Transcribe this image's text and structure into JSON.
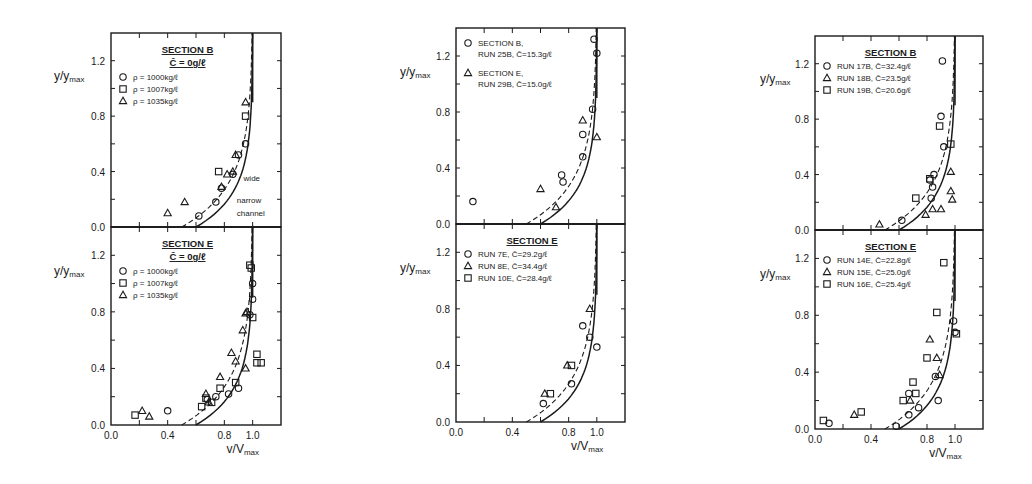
{
  "figure": {
    "background": "#ffffff",
    "ink": "#1a1a1a",
    "x_axis_label": "v/V",
    "x_axis_label_sub": "max",
    "y_axis_label": "y/y",
    "y_axis_label_sub": "max",
    "x_ticks": [
      "0.0",
      "0.4",
      "0.8",
      "1.0"
    ],
    "y_ticks": [
      "0.0",
      "0.4",
      "0.8",
      "1.2"
    ]
  },
  "chart_data": [
    {
      "type": "scatter",
      "panel": "left-top",
      "title": "SECTION B",
      "subtitle": "C̄ = 0g/ℓ",
      "xlabel": "v/Vmax",
      "ylabel": "y/ymax",
      "xlim": [
        0,
        1.0
      ],
      "ylim": [
        0,
        1.4
      ],
      "legend": [
        "ρ = 1000kg/ℓ",
        "ρ = 1007kg/ℓ",
        "ρ = 1035kg/ℓ"
      ],
      "annotations": [
        "wide",
        "narrow channel"
      ],
      "curves": [
        {
          "name": "wide",
          "style": "dashed"
        },
        {
          "name": "narrow channel",
          "style": "solid"
        }
      ],
      "series": [
        {
          "name": "ρ = 1000kg/ℓ",
          "marker": "circle",
          "points": [
            [
              0.62,
              0.08
            ],
            [
              0.74,
              0.18
            ],
            [
              0.78,
              0.28
            ],
            [
              0.86,
              0.38
            ],
            [
              0.9,
              0.52
            ],
            [
              0.95,
              0.6
            ]
          ]
        },
        {
          "name": "ρ = 1007kg/ℓ",
          "marker": "square",
          "points": [
            [
              0.76,
              0.4
            ],
            [
              0.95,
              0.8
            ]
          ]
        },
        {
          "name": "ρ = 1035kg/ℓ",
          "marker": "triangle",
          "points": [
            [
              0.4,
              0.1
            ],
            [
              0.52,
              0.18
            ],
            [
              0.78,
              0.29
            ],
            [
              0.82,
              0.38
            ],
            [
              0.86,
              0.4
            ],
            [
              0.88,
              0.52
            ],
            [
              0.95,
              0.9
            ]
          ]
        }
      ]
    },
    {
      "type": "scatter",
      "panel": "left-bottom",
      "title": "SECTION E",
      "subtitle": "C̄ = 0g/ℓ",
      "xlabel": "v/Vmax",
      "ylabel": "y/ymax",
      "xlim": [
        0,
        1.0
      ],
      "ylim": [
        0,
        1.4
      ],
      "legend": [
        "ρ = 1000kg/ℓ",
        "ρ = 1007kg/ℓ",
        "ρ = 1035kg/ℓ"
      ],
      "series": [
        {
          "name": "ρ = 1000kg/ℓ",
          "marker": "circle",
          "points": [
            [
              0.4,
              0.1
            ],
            [
              0.68,
              0.18
            ],
            [
              0.74,
              0.2
            ],
            [
              0.83,
              0.22
            ],
            [
              0.9,
              0.26
            ],
            [
              1.0,
              1.0
            ],
            [
              1.0,
              0.89
            ],
            [
              0.98,
              0.78
            ]
          ]
        },
        {
          "name": "ρ = 1007kg/ℓ",
          "marker": "square",
          "points": [
            [
              0.17,
              0.07
            ],
            [
              0.64,
              0.13
            ],
            [
              0.67,
              0.19
            ],
            [
              0.71,
              0.16
            ],
            [
              0.77,
              0.26
            ],
            [
              0.88,
              0.3
            ],
            [
              0.98,
              1.13
            ],
            [
              0.99,
              1.11
            ],
            [
              1.0,
              0.76
            ],
            [
              1.03,
              0.5
            ],
            [
              1.03,
              0.44
            ],
            [
              1.06,
              0.44
            ]
          ]
        },
        {
          "name": "ρ = 1035kg/ℓ",
          "marker": "triangle",
          "points": [
            [
              0.22,
              0.1
            ],
            [
              0.27,
              0.06
            ],
            [
              0.67,
              0.22
            ],
            [
              0.69,
              0.16
            ],
            [
              0.77,
              0.34
            ],
            [
              0.85,
              0.51
            ],
            [
              0.88,
              0.45
            ],
            [
              0.93,
              0.67
            ],
            [
              0.95,
              0.79
            ],
            [
              0.96,
              0.8
            ],
            [
              0.95,
              0.4
            ]
          ]
        }
      ]
    },
    {
      "type": "scatter",
      "panel": "middle-top",
      "title": "",
      "xlabel": "v/Vmax",
      "ylabel": "y/ymax",
      "xlim": [
        0,
        1.0
      ],
      "ylim": [
        0,
        1.4
      ],
      "legend": [
        "SECTION B, RUN 25B, C̄=15.3g/ℓ",
        "SECTION E, RUN 29B, C̄=15.0g/ℓ"
      ],
      "series": [
        {
          "name": "SECTION B, RUN 25B, C̄=15.3g/ℓ",
          "marker": "circle",
          "points": [
            [
              0.12,
              0.16
            ],
            [
              0.76,
              0.3
            ],
            [
              0.75,
              0.35
            ],
            [
              0.9,
              0.48
            ],
            [
              0.9,
              0.64
            ],
            [
              0.97,
              0.82
            ],
            [
              1.0,
              1.22
            ],
            [
              0.98,
              1.32
            ]
          ]
        },
        {
          "name": "SECTION E, RUN 29B, C̄=15.0g/ℓ",
          "marker": "triangle",
          "points": [
            [
              0.6,
              0.25
            ],
            [
              0.71,
              0.12
            ],
            [
              0.9,
              0.74
            ],
            [
              1.0,
              0.62
            ]
          ]
        }
      ]
    },
    {
      "type": "scatter",
      "panel": "middle-bottom",
      "title": "SECTION E",
      "xlabel": "v/Vmax",
      "ylabel": "y/ymax",
      "xlim": [
        0,
        1.0
      ],
      "ylim": [
        0,
        1.4
      ],
      "legend": [
        "RUN 7E, C̄=29.2g/ℓ",
        "RUN 8E, C̄=34.4g/ℓ",
        "RUN 10E, C̄=28.4g/ℓ"
      ],
      "series": [
        {
          "name": "RUN 7E, C̄=29.2g/ℓ",
          "marker": "circle",
          "points": [
            [
              0.62,
              0.13
            ],
            [
              0.82,
              0.27
            ],
            [
              0.9,
              0.68
            ],
            [
              0.95,
              0.6
            ],
            [
              1.0,
              0.53
            ]
          ]
        },
        {
          "name": "RUN 8E, C̄=34.4g/ℓ",
          "marker": "triangle",
          "points": [
            [
              0.63,
              0.2
            ],
            [
              0.79,
              0.4
            ],
            [
              0.95,
              0.8
            ]
          ]
        },
        {
          "name": "RUN 10E, C̄=28.4g/ℓ",
          "marker": "square",
          "points": [
            [
              0.67,
              0.2
            ],
            [
              0.82,
              0.4
            ]
          ]
        }
      ]
    },
    {
      "type": "scatter",
      "panel": "right-top",
      "title": "SECTION B",
      "xlabel": "v/Vmax",
      "ylabel": "y/ymax",
      "xlim": [
        0,
        1.0
      ],
      "ylim": [
        0,
        1.4
      ],
      "legend": [
        "RUN 17B, C̄=32.4g/ℓ",
        "RUN 18B, C̄=23.5g/ℓ",
        "RUN 19B, C̄=20.6g/ℓ"
      ],
      "series": [
        {
          "name": "RUN 17B, C̄=32.4g/ℓ",
          "marker": "circle",
          "points": [
            [
              0.62,
              0.07
            ],
            [
              0.83,
              0.23
            ],
            [
              0.84,
              0.31
            ],
            [
              0.82,
              0.36
            ],
            [
              0.85,
              0.4
            ],
            [
              0.92,
              0.6
            ],
            [
              0.9,
              0.82
            ],
            [
              0.91,
              1.22
            ]
          ]
        },
        {
          "name": "RUN 18B, C̄=23.5g/ℓ",
          "marker": "triangle",
          "points": [
            [
              0.46,
              0.04
            ],
            [
              0.79,
              0.11
            ],
            [
              0.84,
              0.15
            ],
            [
              0.9,
              0.15
            ],
            [
              0.97,
              0.42
            ],
            [
              0.97,
              0.28
            ],
            [
              0.98,
              0.22
            ]
          ]
        },
        {
          "name": "RUN 19B, C̄=20.6g/ℓ",
          "marker": "square",
          "points": [
            [
              0.72,
              0.23
            ],
            [
              0.82,
              0.37
            ],
            [
              0.89,
              0.75
            ],
            [
              0.97,
              0.62
            ]
          ]
        }
      ]
    },
    {
      "type": "scatter",
      "panel": "right-bottom",
      "title": "SECTION E",
      "xlabel": "v/Vmax",
      "ylabel": "y/ymax",
      "xlim": [
        0,
        1.0
      ],
      "ylim": [
        0,
        1.4
      ],
      "legend": [
        "RUN 14E, C̄=22.8g/ℓ",
        "RUN 15E, C̄=25.0g/ℓ",
        "RUN 16E, C̄=25.4g/ℓ"
      ],
      "series": [
        {
          "name": "RUN 14E, C̄=22.8g/ℓ",
          "marker": "circle",
          "points": [
            [
              0.1,
              0.04
            ],
            [
              0.58,
              0.02
            ],
            [
              0.67,
              0.1
            ],
            [
              0.74,
              0.15
            ],
            [
              0.67,
              0.25
            ],
            [
              0.86,
              0.37
            ],
            [
              0.88,
              0.2
            ],
            [
              0.99,
              0.76
            ],
            [
              1.0,
              0.68
            ]
          ]
        },
        {
          "name": "RUN 15E, C̄=25.0g/ℓ",
          "marker": "triangle",
          "points": [
            [
              0.28,
              0.1
            ],
            [
              0.68,
              0.2
            ],
            [
              0.82,
              0.63
            ],
            [
              0.87,
              0.5
            ],
            [
              0.89,
              0.38
            ]
          ]
        },
        {
          "name": "RUN 16E, C̄=25.4g/ℓ",
          "marker": "square",
          "points": [
            [
              0.06,
              0.06
            ],
            [
              0.33,
              0.12
            ],
            [
              0.63,
              0.2
            ],
            [
              0.7,
              0.33
            ],
            [
              0.72,
              0.25
            ],
            [
              0.8,
              0.5
            ],
            [
              0.87,
              0.82
            ],
            [
              0.92,
              1.17
            ],
            [
              1.01,
              0.67
            ]
          ]
        }
      ]
    }
  ]
}
